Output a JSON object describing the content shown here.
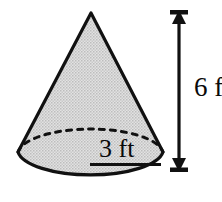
{
  "figure": {
    "name": "cone-dimension-diagram",
    "shape": "cone",
    "background_color": "#ffffff",
    "outline_color": "#111111",
    "fill_color": "#cfcfcf",
    "fill_style": "stippled-gray"
  },
  "labels": {
    "height": "6 ft",
    "radius": "3 ft"
  },
  "measurements": {
    "height_value": 6,
    "height_unit": "ft",
    "radius_value": 3,
    "radius_unit": "ft"
  },
  "annotations": {
    "height_dimension_line": "vertical-double-arrow",
    "radius_dimension_line": "horizontal-underline",
    "hidden_base_edge": "dashed-ellipse-arc"
  }
}
